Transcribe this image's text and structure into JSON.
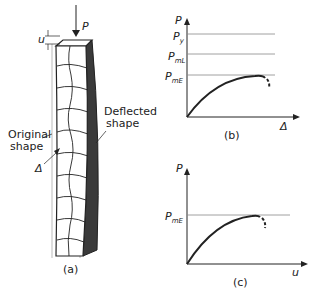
{
  "figure_a": {
    "load_label": "P",
    "displacement_label": "u",
    "deflected_label_line1": "Deflected",
    "deflected_label_line2": "shape",
    "original_label_line1": "Original",
    "original_label_line2": "shape",
    "delta_label": "Δ",
    "caption": "(a)"
  },
  "figure_b": {
    "y_axis_label": "P",
    "x_axis_label": "Δ",
    "level_y": "P",
    "level_y_sub": "y",
    "level_mL": "P",
    "level_mL_sub": "mL",
    "level_mE": "P",
    "level_mE_sub": "mE",
    "caption": "(b)"
  },
  "figure_c": {
    "y_axis_label": "P",
    "x_axis_label": "u",
    "level_mE": "P",
    "level_mE_sub": "mE",
    "caption": "(c)"
  },
  "colors": {
    "line": "#222222",
    "guide": "#888888",
    "dark_face": "#3a3a3a"
  }
}
